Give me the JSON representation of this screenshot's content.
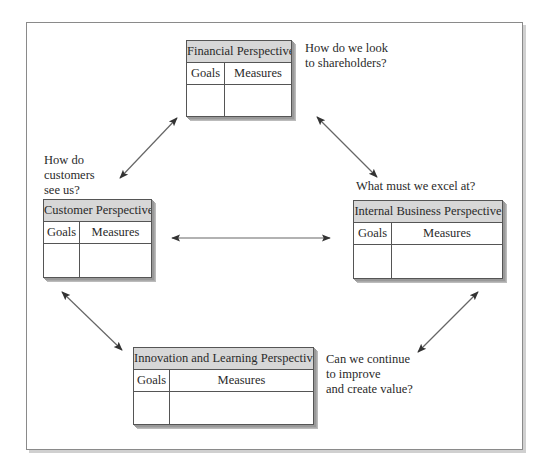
{
  "diagram": {
    "boxes": [
      {
        "id": "financial",
        "title": "Financial Perspective",
        "col1": "Goals",
        "col2": "Measures"
      },
      {
        "id": "customer",
        "title": "Customer Perspective",
        "col1": "Goals",
        "col2": "Measures"
      },
      {
        "id": "internal",
        "title": "Internal Business Perspective",
        "col1": "Goals",
        "col2": "Measures"
      },
      {
        "id": "innovation",
        "title": "Innovation and Learning Perspective",
        "col1": "Goals",
        "col2": "Measures"
      }
    ],
    "questions": {
      "financial": "How do we look\nto shareholders?",
      "customer": "How do\ncustomers\nsee us?",
      "internal": "What must we excel at?",
      "innovation": "Can we continue\nto improve\nand create value?"
    },
    "colors": {
      "title_fill": "#d7d7d7",
      "border": "#555555",
      "arrow": "#555555",
      "frame": "#8a8a8a"
    }
  }
}
